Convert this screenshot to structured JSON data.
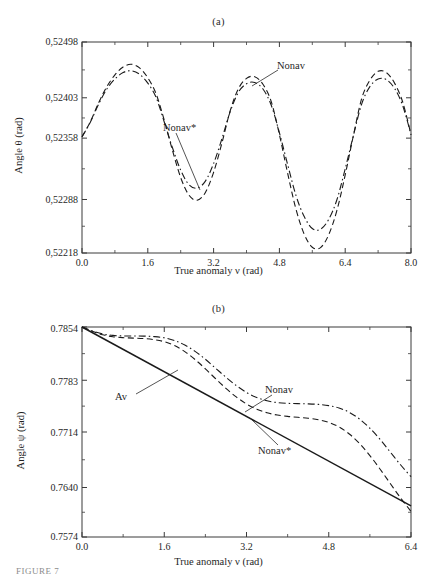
{
  "figure": {
    "caption": "FIGURE 7",
    "panels": [
      "a",
      "b"
    ]
  },
  "chart_data": [
    {
      "type": "line",
      "panel": "(a)",
      "title": "(a)",
      "xlabel": "True anomaly  ν (rad)",
      "ylabel": "Angle θ (rad)",
      "xlim": [
        0.0,
        8.0
      ],
      "ylim": [
        0.52218,
        0.52498
      ],
      "xticks": [
        "0.0",
        "1.6",
        "3.2",
        "4.8",
        "6.4",
        "8.0"
      ],
      "xtick_values": [
        0.0,
        1.6,
        3.2,
        4.8,
        6.4,
        8.0
      ],
      "yticks": [
        "0,52498",
        "0,52403",
        "0,52358",
        "0,52288",
        "0,52218"
      ],
      "ytick_values": [
        0.52498,
        0.52403,
        0.52358,
        0.52288,
        0.52218
      ],
      "ytick_positions_frac": [
        0.0,
        0.2644,
        0.4556,
        0.7464,
        1.0
      ],
      "grid": false,
      "legend": "annotations",
      "annotations": [
        {
          "text": "Nonav",
          "target": "dashed-curve"
        },
        {
          "text": "Nonav*",
          "target": "dashdot-curve"
        }
      ],
      "series": [
        {
          "name": "Nonav",
          "style": "dashed",
          "x": [
            0.0,
            0.2,
            0.4,
            0.6,
            0.8,
            1.0,
            1.2,
            1.4,
            1.6,
            1.8,
            2.0,
            2.2,
            2.4,
            2.6,
            2.8,
            3.0,
            3.2,
            3.4,
            3.6,
            3.8,
            4.0,
            4.2,
            4.4,
            4.6,
            4.8,
            5.0,
            5.2,
            5.4,
            5.6,
            5.8,
            6.0,
            6.2,
            6.4,
            6.6,
            6.8,
            7.0,
            7.2,
            7.4,
            7.6,
            7.8,
            8.0
          ],
          "y": [
            0.523595,
            0.52376,
            0.52397,
            0.524215,
            0.52442,
            0.524555,
            0.5246,
            0.52454,
            0.52437,
            0.5241,
            0.52378,
            0.52344,
            0.52313,
            0.52293,
            0.52287,
            0.52296,
            0.52319,
            0.52352,
            0.52388,
            0.52418,
            0.52436,
            0.52439,
            0.52426,
            0.52399,
            0.52362,
            0.52318,
            0.52276,
            0.52243,
            0.522255,
            0.52225,
            0.52242,
            0.52274,
            0.52316,
            0.52361,
            0.52402,
            0.52433,
            0.52448,
            0.52446,
            0.52428,
            0.52398,
            0.52362
          ]
        },
        {
          "name": "Nonav*",
          "style": "dashdot",
          "x": [
            0.0,
            0.2,
            0.4,
            0.6,
            0.8,
            1.0,
            1.2,
            1.4,
            1.6,
            1.8,
            2.0,
            2.2,
            2.4,
            2.6,
            2.8,
            3.0,
            3.2,
            3.4,
            3.6,
            3.8,
            4.0,
            4.2,
            4.4,
            4.6,
            4.8,
            5.0,
            5.2,
            5.4,
            5.6,
            5.8,
            6.0,
            6.2,
            6.4,
            6.6,
            6.8,
            7.0,
            7.2,
            7.4,
            7.6,
            7.8,
            8.0
          ],
          "y": [
            0.523595,
            0.523755,
            0.523955,
            0.524175,
            0.52435,
            0.52446,
            0.52449,
            0.52443,
            0.52428,
            0.52404,
            0.52376,
            0.52347,
            0.523215,
            0.52305,
            0.52301,
            0.52309,
            0.52329,
            0.52357,
            0.52387,
            0.52412,
            0.52427,
            0.52429,
            0.52418,
            0.52395,
            0.52364,
            0.52328,
            0.52293,
            0.52266,
            0.5225,
            0.52249,
            0.52262,
            0.52288,
            0.52323,
            0.52361,
            0.52396,
            0.52422,
            0.52435,
            0.52434,
            0.52419,
            0.52394,
            0.52362
          ]
        }
      ]
    },
    {
      "type": "line",
      "panel": "(b)",
      "title": "(b)",
      "xlabel": "True anomaly ν (rad)",
      "ylabel": "Angle ψ (rad)",
      "xlim": [
        0.0,
        6.4
      ],
      "ylim": [
        0.7574,
        0.7854
      ],
      "xticks": [
        "0.0",
        "1.6",
        "3.2",
        "4.8",
        "6.4"
      ],
      "xtick_values": [
        0.0,
        1.6,
        3.2,
        4.8,
        6.4
      ],
      "yticks": [
        "0.7854",
        "0.7783",
        "0.7714",
        "0.7640",
        "0.7574"
      ],
      "ytick_values": [
        0.7854,
        0.7783,
        0.7714,
        0.764,
        0.7574
      ],
      "ytick_positions_frac": [
        0.0,
        0.2536,
        0.5,
        0.7643,
        1.0
      ],
      "grid": false,
      "legend": "annotations",
      "annotations": [
        {
          "text": "Av",
          "target": "solid-line"
        },
        {
          "text": "Nonav",
          "target": "dashdot-curve"
        },
        {
          "text": "Nonav*",
          "target": "dashed-curve"
        }
      ],
      "series": [
        {
          "name": "Av",
          "style": "solid",
          "x": [
            0.0,
            6.4
          ],
          "y": [
            0.7854,
            0.76155
          ]
        },
        {
          "name": "Nonav",
          "style": "dashdot",
          "x": [
            0.0,
            0.2,
            0.4,
            0.6,
            0.8,
            1.0,
            1.2,
            1.4,
            1.6,
            1.8,
            2.0,
            2.2,
            2.4,
            2.6,
            2.8,
            3.0,
            3.2,
            3.4,
            3.6,
            3.8,
            4.0,
            4.2,
            4.4,
            4.6,
            4.8,
            5.0,
            5.2,
            5.4,
            5.6,
            5.8,
            6.0,
            6.2,
            6.4
          ],
          "y": [
            0.7854,
            0.78488,
            0.78448,
            0.78428,
            0.78421,
            0.7842,
            0.78419,
            0.78412,
            0.78396,
            0.7836,
            0.783,
            0.78215,
            0.7811,
            0.7799,
            0.7787,
            0.7776,
            0.77668,
            0.776,
            0.77556,
            0.77532,
            0.77522,
            0.77518,
            0.77515,
            0.77508,
            0.77492,
            0.7746,
            0.77402,
            0.77312,
            0.7719,
            0.7704,
            0.7687,
            0.767,
            0.76545
          ]
        },
        {
          "name": "Nonav*",
          "style": "dashed",
          "x": [
            0.0,
            0.2,
            0.4,
            0.6,
            0.8,
            1.0,
            1.2,
            1.4,
            1.6,
            1.8,
            2.0,
            2.2,
            2.4,
            2.6,
            2.8,
            3.0,
            3.2,
            3.4,
            3.6,
            3.8,
            4.0,
            4.2,
            4.4,
            4.6,
            4.8,
            5.0,
            5.2,
            5.4,
            5.6,
            5.8,
            6.0,
            6.2,
            6.4
          ],
          "y": [
            0.7854,
            0.78482,
            0.78436,
            0.7841,
            0.78398,
            0.78392,
            0.78386,
            0.78372,
            0.78344,
            0.78292,
            0.78212,
            0.78106,
            0.77982,
            0.7785,
            0.77722,
            0.77608,
            0.77514,
            0.77444,
            0.77396,
            0.77366,
            0.77348,
            0.77336,
            0.77324,
            0.77304,
            0.77268,
            0.77208,
            0.77114,
            0.76986,
            0.76826,
            0.76644,
            0.7645,
            0.76258,
            0.76082
          ]
        }
      ]
    }
  ]
}
